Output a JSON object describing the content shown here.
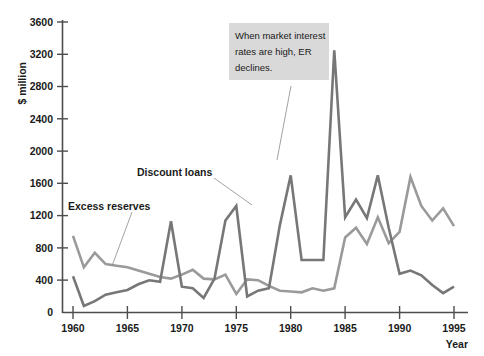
{
  "chart_data": {
    "type": "line",
    "title": "",
    "xlabel": "Year",
    "ylabel": "$ million",
    "xlim": [
      1960,
      1995
    ],
    "ylim": [
      0,
      3600
    ],
    "grid": false,
    "legend_position": "inline-annotations",
    "x": [
      1960,
      1961,
      1962,
      1963,
      1964,
      1965,
      1966,
      1967,
      1968,
      1969,
      1970,
      1971,
      1972,
      1973,
      1974,
      1975,
      1976,
      1977,
      1978,
      1979,
      1980,
      1981,
      1982,
      1983,
      1984,
      1985,
      1986,
      1987,
      1988,
      1989,
      1990,
      1991,
      1992,
      1993,
      1994,
      1995
    ],
    "xticks": [
      1960,
      1965,
      1970,
      1975,
      1980,
      1985,
      1990,
      1995
    ],
    "yticks": [
      0,
      400,
      800,
      1200,
      1600,
      2000,
      2400,
      2800,
      3200,
      3600
    ],
    "series": [
      {
        "name": "Excess reserves",
        "color": "#9a9a9a",
        "values": [
          950,
          560,
          740,
          600,
          580,
          560,
          520,
          480,
          440,
          420,
          470,
          530,
          420,
          410,
          470,
          230,
          410,
          400,
          330,
          270,
          260,
          250,
          300,
          270,
          300,
          930,
          1050,
          850,
          1180,
          860,
          1000,
          1680,
          1320,
          1140,
          1290,
          1070
        ]
      },
      {
        "name": "Discount loans",
        "color": "#777777",
        "values": [
          450,
          80,
          140,
          220,
          250,
          280,
          350,
          400,
          380,
          1130,
          320,
          300,
          180,
          420,
          1140,
          1320,
          200,
          270,
          300,
          1080,
          1700,
          650,
          650,
          650,
          3250,
          1180,
          1400,
          1170,
          1700,
          1050,
          480,
          520,
          460,
          340,
          240,
          320
        ]
      }
    ],
    "annotations": [
      {
        "name": "er-declines-note",
        "text": "When market interest rates are high, ER declines.",
        "lines": [
          "When market interest",
          "rates are high, ER",
          "declines."
        ],
        "background": "#d9d9d9"
      }
    ],
    "series_labels": [
      {
        "name": "Discount loans",
        "text": "Discount loans"
      },
      {
        "name": "Excess reserves",
        "text": "Excess reserves"
      }
    ]
  },
  "axis": {
    "y_title": "$ million",
    "x_title": "Year",
    "y_tick_labels": [
      "3600",
      "3200",
      "2800",
      "2400",
      "2000",
      "1600",
      "1200",
      "800",
      "400",
      "0"
    ],
    "x_tick_labels": [
      "1960",
      "1965",
      "1970",
      "1975",
      "1980",
      "1985",
      "1990",
      "1995"
    ]
  },
  "labels": {
    "discount_loans": "Discount loans",
    "excess_reserves": "Excess reserves"
  },
  "annotation": {
    "line1": "When market interest",
    "line2": "rates are high, ER",
    "line3": "declines."
  },
  "colors": {
    "background": "#ffffff",
    "axis": "#4d4d4d",
    "excess_reserves": "#9a9a9a",
    "discount_loans": "#777777",
    "annotation_bg": "#d9d9d9",
    "text": "#1a1a1a"
  }
}
